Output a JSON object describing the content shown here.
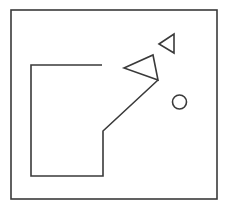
{
  "canvas": {
    "width": 228,
    "height": 208,
    "background_color": "#ffffff",
    "stroke_color": "#3a3a3a"
  },
  "frame": {
    "name": "outer-border",
    "x": 11,
    "y": 10,
    "width": 206,
    "height": 189,
    "stroke_width": 1.6,
    "fill": "none"
  },
  "shapes": [
    {
      "name": "open-polyline-block",
      "type": "polyline",
      "points": "102,65 31,65 31,176 103,176 103,131 158,80",
      "stroke_width": 1.6,
      "fill": "none"
    },
    {
      "name": "large-triangle",
      "type": "polygon",
      "points": "124,68 153,55 158,80",
      "stroke_width": 1.6,
      "fill": "none"
    },
    {
      "name": "small-triangle",
      "type": "polygon",
      "points": "159,44 174,34 174,53",
      "stroke_width": 1.6,
      "fill": "none"
    },
    {
      "name": "circle",
      "type": "circle",
      "cx": 179.5,
      "cy": 102,
      "r": 7,
      "stroke_width": 1.6,
      "fill": "none"
    }
  ]
}
